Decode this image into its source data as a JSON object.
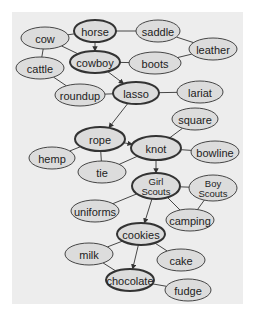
{
  "diagram": {
    "type": "semantic-network",
    "colors": {
      "panel": "#ededed",
      "node_fill": "#dcdcdc",
      "stroke": "#333333",
      "text": "#222222"
    },
    "nodes": [
      {
        "id": "horse",
        "label": "horse",
        "x": 95,
        "y": 31,
        "rx": 21,
        "ry": 11,
        "bold": true
      },
      {
        "id": "saddle",
        "label": "saddle",
        "x": 158,
        "y": 31,
        "rx": 22,
        "ry": 11,
        "bold": false
      },
      {
        "id": "cow",
        "label": "cow",
        "x": 45,
        "y": 38,
        "rx": 24,
        "ry": 11,
        "bold": false
      },
      {
        "id": "leather",
        "label": "leather",
        "x": 213,
        "y": 49,
        "rx": 24,
        "ry": 11,
        "bold": false
      },
      {
        "id": "cowboy",
        "label": "cowboy",
        "x": 95,
        "y": 62,
        "rx": 25,
        "ry": 11,
        "bold": true
      },
      {
        "id": "boots",
        "label": "boots",
        "x": 155,
        "y": 63,
        "rx": 26,
        "ry": 11,
        "bold": false
      },
      {
        "id": "cattle",
        "label": "cattle",
        "x": 40,
        "y": 68,
        "rx": 24,
        "ry": 11,
        "bold": false
      },
      {
        "id": "roundup",
        "label": "roundup",
        "x": 80,
        "y": 95,
        "rx": 25,
        "ry": 11,
        "bold": false
      },
      {
        "id": "lasso",
        "label": "lasso",
        "x": 136,
        "y": 93,
        "rx": 23,
        "ry": 11,
        "bold": true
      },
      {
        "id": "lariat",
        "label": "lariat",
        "x": 200,
        "y": 92,
        "rx": 23,
        "ry": 11,
        "bold": false
      },
      {
        "id": "rope",
        "label": "rope",
        "x": 100,
        "y": 139,
        "rx": 25,
        "ry": 12,
        "bold": true
      },
      {
        "id": "square",
        "label": "square",
        "x": 195,
        "y": 119,
        "rx": 23,
        "ry": 11,
        "bold": false
      },
      {
        "id": "hemp",
        "label": "hemp",
        "x": 52,
        "y": 158,
        "rx": 23,
        "ry": 11,
        "bold": false
      },
      {
        "id": "knot",
        "label": "knot",
        "x": 156,
        "y": 148,
        "rx": 25,
        "ry": 12,
        "bold": true
      },
      {
        "id": "bowline",
        "label": "bowline",
        "x": 215,
        "y": 152,
        "rx": 24,
        "ry": 11,
        "bold": false
      },
      {
        "id": "tie",
        "label": "tie",
        "x": 102,
        "y": 172,
        "rx": 24,
        "ry": 11,
        "bold": false
      },
      {
        "id": "girl_scouts",
        "label": "Girl|Scouts",
        "x": 156,
        "y": 186,
        "rx": 24,
        "ry": 13,
        "bold": true
      },
      {
        "id": "boy_scouts",
        "label": "Boy|Scouts",
        "x": 213,
        "y": 188,
        "rx": 24,
        "ry": 13,
        "bold": false
      },
      {
        "id": "uniforms",
        "label": "uniforms",
        "x": 95,
        "y": 211,
        "rx": 24,
        "ry": 11,
        "bold": false
      },
      {
        "id": "camping",
        "label": "camping",
        "x": 190,
        "y": 220,
        "rx": 24,
        "ry": 11,
        "bold": false
      },
      {
        "id": "cookies",
        "label": "cookies",
        "x": 141,
        "y": 234,
        "rx": 24,
        "ry": 11,
        "bold": true
      },
      {
        "id": "milk",
        "label": "milk",
        "x": 89,
        "y": 254,
        "rx": 24,
        "ry": 11,
        "bold": false
      },
      {
        "id": "cake",
        "label": "cake",
        "x": 181,
        "y": 260,
        "rx": 24,
        "ry": 11,
        "bold": false
      },
      {
        "id": "chocolate",
        "label": "chocolate",
        "x": 130,
        "y": 280,
        "rx": 24,
        "ry": 11,
        "bold": true
      },
      {
        "id": "fudge",
        "label": "fudge",
        "x": 188,
        "y": 290,
        "rx": 23,
        "ry": 11,
        "bold": false
      }
    ],
    "edges": [
      {
        "from": "horse",
        "to": "saddle",
        "arrow": false
      },
      {
        "from": "horse",
        "to": "cow",
        "arrow": false
      },
      {
        "from": "horse",
        "to": "cowboy",
        "arrow": true
      },
      {
        "from": "saddle",
        "to": "leather",
        "arrow": false
      },
      {
        "from": "boots",
        "to": "leather",
        "arrow": false
      },
      {
        "from": "cow",
        "to": "cowboy",
        "arrow": false
      },
      {
        "from": "cow",
        "to": "cattle",
        "arrow": false
      },
      {
        "from": "cowboy",
        "to": "boots",
        "arrow": false
      },
      {
        "from": "cowboy",
        "to": "lasso",
        "arrow": true
      },
      {
        "from": "cattle",
        "to": "roundup",
        "arrow": false
      },
      {
        "from": "roundup",
        "to": "lasso",
        "arrow": false
      },
      {
        "from": "lasso",
        "to": "lariat",
        "arrow": false
      },
      {
        "from": "lasso",
        "to": "rope",
        "arrow": true
      },
      {
        "from": "rope",
        "to": "hemp",
        "arrow": false
      },
      {
        "from": "rope",
        "to": "tie",
        "arrow": false
      },
      {
        "from": "rope",
        "to": "knot",
        "arrow": true
      },
      {
        "from": "knot",
        "to": "square",
        "arrow": false
      },
      {
        "from": "knot",
        "to": "bowline",
        "arrow": false
      },
      {
        "from": "knot",
        "to": "tie",
        "arrow": false
      },
      {
        "from": "knot",
        "to": "girl_scouts",
        "arrow": true
      },
      {
        "from": "girl_scouts",
        "to": "boy_scouts",
        "arrow": false
      },
      {
        "from": "girl_scouts",
        "to": "uniforms",
        "arrow": false
      },
      {
        "from": "girl_scouts",
        "to": "camping",
        "arrow": false
      },
      {
        "from": "boy_scouts",
        "to": "camping",
        "arrow": false
      },
      {
        "from": "girl_scouts",
        "to": "cookies",
        "arrow": true
      },
      {
        "from": "cookies",
        "to": "milk",
        "arrow": false
      },
      {
        "from": "cookies",
        "to": "cake",
        "arrow": false
      },
      {
        "from": "milk",
        "to": "chocolate",
        "arrow": false
      },
      {
        "from": "cookies",
        "to": "chocolate",
        "arrow": true
      },
      {
        "from": "chocolate",
        "to": "fudge",
        "arrow": false
      }
    ]
  }
}
